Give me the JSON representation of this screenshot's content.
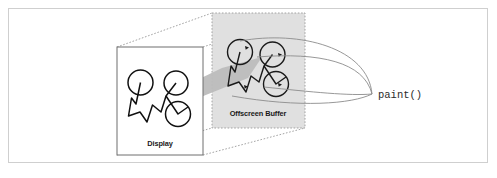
{
  "figure": {
    "background_color": "#ffffff",
    "border_color": "#cfcfcf"
  },
  "display_panel": {
    "label": "Display",
    "fill_color": "#ffffff",
    "stroke_color": "#6e6e6e"
  },
  "buffer_panel": {
    "label": "Offscreen Buffer",
    "fill_color": "#e0e0e0",
    "stroke_color": "#9a9a9a"
  },
  "paint_call": {
    "label": "paint()",
    "stroke_color": "#8c8c8c"
  },
  "beam": {
    "color": "#b9b9b9"
  },
  "sketch": {
    "display_stroke_color": "#111111",
    "buffer_stroke_color": "#1a1a1a"
  },
  "icons": {
    "display_panel_icon": "display-panel-icon",
    "buffer_panel_icon": "offscreen-buffer-panel-icon",
    "beam_icon": "projection-beam-icon",
    "paint_arrow_icon": "paint-curve-arrow-icon",
    "drawing_icon": "sketch-drawing-icon"
  }
}
